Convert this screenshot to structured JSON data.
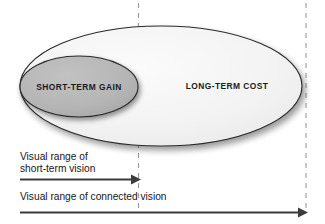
{
  "diagram": {
    "outer_ellipse": {
      "label": "LONG-TERM COST",
      "fill_color": "#f4f4f4",
      "stroke_color": "#2a2a2a"
    },
    "inner_ellipse": {
      "label": "SHORT-TERM GAIN",
      "fill_color": "#b4b4b4",
      "stroke_color": "#2a2a2a"
    },
    "guides": [
      {
        "name": "short-term-boundary",
        "color": "#9a9a9a"
      },
      {
        "name": "connected-boundary",
        "color": "#9a9a9a"
      }
    ],
    "arrows": [
      {
        "name": "short-term-vision-arrow",
        "label_line1": "Visual range of",
        "label_line2": "short-term vision",
        "color": "#3c3c3c"
      },
      {
        "name": "connected-vision-arrow",
        "label_line1": "Visual range of connected vision",
        "label_line2": "",
        "color": "#3c3c3c"
      }
    ]
  }
}
